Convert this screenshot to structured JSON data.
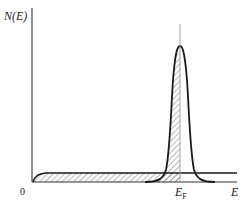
{
  "diagram": {
    "y_axis_label": "N(E)",
    "x_axis_label": "E",
    "origin_label": "0",
    "fermi_label_main": "E",
    "fermi_label_sub": "F",
    "elements": {
      "conduction_band": "broad flat band starting near 0, filled (hatched) up to E_F",
      "localized_peak": "narrow peak centred at E_F, hatched below E_F",
      "fermi_level": "thin vertical line at E_F"
    },
    "colors": {
      "stroke": "#1a1a1a",
      "hatch": "#555555",
      "fermi_line": "#999999",
      "background": "#ffffff"
    }
  }
}
